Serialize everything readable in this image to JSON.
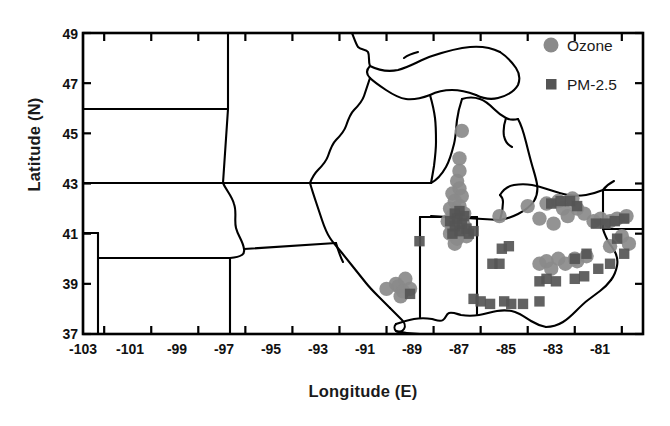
{
  "figure": {
    "type": "map-scatter",
    "background": "#ffffff",
    "frame_color": "#000000"
  },
  "axes": {
    "xlabel": "Longitude (E)",
    "ylabel": "Latitude (N)",
    "xticks": [
      "-103",
      "-101",
      "-99",
      "-97",
      "-95",
      "-93",
      "-91",
      "-89",
      "-87",
      "-85",
      "-83",
      "-81"
    ],
    "yticks": [
      "49",
      "47",
      "45",
      "43",
      "41",
      "39",
      "37"
    ],
    "xlim": [
      -103.9,
      -80.1
    ],
    "ylim": [
      37,
      49
    ]
  },
  "legend": {
    "items": [
      {
        "label": "Ozone",
        "marker": "circle",
        "color": "#8a8a8a"
      },
      {
        "label": "PM-2.5",
        "marker": "square",
        "color": "#555555"
      }
    ]
  },
  "chart_data": {
    "type": "scatter",
    "title": "",
    "xlabel": "Longitude (E)",
    "ylabel": "Latitude (N)",
    "xlim": [
      -103.9,
      -80.1
    ],
    "ylim": [
      37,
      49
    ],
    "grid": false,
    "legend_position": "top-right",
    "series": [
      {
        "name": "Ozone",
        "marker": "circle",
        "color": "#8a8a8a",
        "points": [
          [
            -87.8,
            45.1
          ],
          [
            -87.9,
            44.0
          ],
          [
            -87.9,
            43.5
          ],
          [
            -88.0,
            43.1
          ],
          [
            -87.9,
            42.8
          ],
          [
            -88.2,
            42.6
          ],
          [
            -87.8,
            42.5
          ],
          [
            -88.1,
            42.3
          ],
          [
            -87.9,
            42.1
          ],
          [
            -88.3,
            42.0
          ],
          [
            -88.0,
            41.9
          ],
          [
            -87.7,
            41.8
          ],
          [
            -88.2,
            41.7
          ],
          [
            -87.9,
            41.6
          ],
          [
            -88.4,
            41.5
          ],
          [
            -88.0,
            41.4
          ],
          [
            -87.7,
            41.3
          ],
          [
            -88.2,
            41.2
          ],
          [
            -87.9,
            41.1
          ],
          [
            -88.3,
            41.0
          ],
          [
            -88.0,
            40.8
          ],
          [
            -87.6,
            40.9
          ],
          [
            -88.1,
            40.6
          ],
          [
            -86.2,
            41.7
          ],
          [
            -85.0,
            42.1
          ],
          [
            -90.5,
            38.9
          ],
          [
            -90.2,
            39.2
          ],
          [
            -90.6,
            39.0
          ],
          [
            -90.3,
            38.7
          ],
          [
            -90.0,
            38.8
          ],
          [
            -91.0,
            38.8
          ],
          [
            -90.4,
            38.5
          ],
          [
            -83.7,
            42.3
          ],
          [
            -83.1,
            42.4
          ],
          [
            -83.5,
            42.0
          ],
          [
            -82.9,
            42.0
          ],
          [
            -84.2,
            42.2
          ],
          [
            -83.3,
            41.7
          ],
          [
            -82.6,
            41.8
          ],
          [
            -81.9,
            41.6
          ],
          [
            -81.5,
            41.5
          ],
          [
            -81.2,
            41.6
          ],
          [
            -80.8,
            41.7
          ],
          [
            -82.2,
            41.5
          ],
          [
            -84.5,
            41.6
          ],
          [
            -83.9,
            41.4
          ],
          [
            -84.5,
            39.8
          ],
          [
            -84.2,
            39.9
          ],
          [
            -83.7,
            40.0
          ],
          [
            -83.0,
            40.0
          ],
          [
            -82.9,
            39.9
          ],
          [
            -84.0,
            39.6
          ],
          [
            -83.4,
            39.8
          ],
          [
            -82.5,
            40.1
          ],
          [
            -81.5,
            40.5
          ],
          [
            -81.0,
            40.9
          ],
          [
            -80.7,
            40.6
          ]
        ]
      },
      {
        "name": "PM-2.5",
        "marker": "square",
        "color": "#555555",
        "points": [
          [
            -87.9,
            41.9
          ],
          [
            -88.1,
            41.8
          ],
          [
            -87.7,
            41.7
          ],
          [
            -88.0,
            41.6
          ],
          [
            -88.3,
            41.5
          ],
          [
            -87.8,
            41.4
          ],
          [
            -88.1,
            41.3
          ],
          [
            -87.6,
            41.2
          ],
          [
            -87.9,
            41.1
          ],
          [
            -88.2,
            41.0
          ],
          [
            -87.5,
            41.0
          ],
          [
            -87.3,
            41.1
          ],
          [
            -89.6,
            40.7
          ],
          [
            -90.0,
            38.6
          ],
          [
            -86.1,
            40.4
          ],
          [
            -85.8,
            40.5
          ],
          [
            -86.5,
            39.8
          ],
          [
            -86.2,
            39.8
          ],
          [
            -87.3,
            38.4
          ],
          [
            -87.0,
            38.3
          ],
          [
            -86.6,
            38.2
          ],
          [
            -86.0,
            38.3
          ],
          [
            -85.7,
            38.2
          ],
          [
            -85.2,
            38.2
          ],
          [
            -84.5,
            38.3
          ],
          [
            -84.5,
            39.1
          ],
          [
            -84.2,
            39.2
          ],
          [
            -83.8,
            39.1
          ],
          [
            -83.0,
            39.2
          ],
          [
            -82.6,
            39.3
          ],
          [
            -82.0,
            39.6
          ],
          [
            -81.5,
            39.8
          ],
          [
            -83.0,
            40.0
          ],
          [
            -82.5,
            40.2
          ],
          [
            -81.7,
            41.4
          ],
          [
            -81.3,
            41.5
          ],
          [
            -80.9,
            41.6
          ],
          [
            -82.1,
            41.4
          ],
          [
            -83.6,
            42.3
          ],
          [
            -83.2,
            42.3
          ],
          [
            -84.0,
            42.2
          ],
          [
            -82.9,
            42.1
          ],
          [
            -81.2,
            40.8
          ],
          [
            -80.9,
            40.2
          ]
        ]
      }
    ]
  }
}
